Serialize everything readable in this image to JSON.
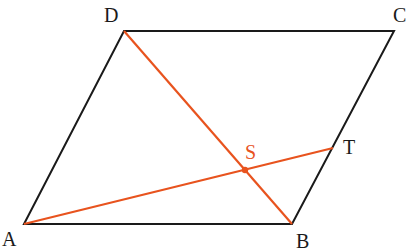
{
  "figure": {
    "type": "parallelogram-diagram",
    "colors": {
      "edge": "#1a1a1a",
      "accent": "#e8531e",
      "background": "#ffffff"
    },
    "points": {
      "A": {
        "label": "A",
        "x": 24,
        "y": 224,
        "label_x": 2,
        "label_y": 246
      },
      "B": {
        "label": "B",
        "x": 292,
        "y": 224,
        "label_x": 296,
        "label_y": 248
      },
      "C": {
        "label": "C",
        "x": 394,
        "y": 31,
        "label_x": 393,
        "label_y": 22
      },
      "D": {
        "label": "D",
        "x": 124,
        "y": 31,
        "label_x": 104,
        "label_y": 22
      },
      "T": {
        "label": "T",
        "x": 333,
        "y": 148,
        "label_x": 343,
        "label_y": 154
      },
      "S": {
        "label": "S",
        "x": 245,
        "y": 170,
        "label_x": 245,
        "label_y": 159
      }
    },
    "edges": [
      "AB",
      "BC",
      "CD",
      "DA"
    ],
    "accent_segments": [
      "DB",
      "AT"
    ],
    "intersection": "S"
  }
}
